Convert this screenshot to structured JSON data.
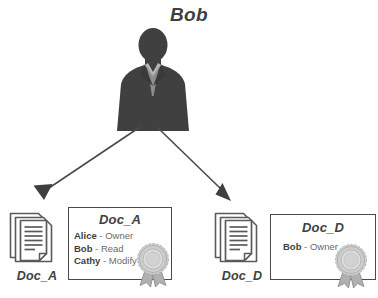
{
  "diagram": {
    "title_person": "Bob",
    "person": {
      "name": "Bob",
      "icon": "person-silhouette-icon"
    },
    "colors": {
      "silhouette": "#404040",
      "shirt": "#b9b9b9",
      "arrow": "#4a4a4a",
      "box_border": "#4a4a4a",
      "label_text": "#3f3f3f",
      "entry_text": "#6b6b6b",
      "seal": "#c8c8c8",
      "background": "#ffffff"
    },
    "documents": [
      {
        "id": "doc-a",
        "caption": "Doc_A",
        "icon": "document-stack-icon",
        "acl": {
          "title": "Doc_A",
          "seal_icon": "seal-ribbon-icon",
          "entries": [
            {
              "subject": "Alice",
              "separator": "-",
              "right": "Owner"
            },
            {
              "subject": "Bob",
              "separator": "-",
              "right": "Read"
            },
            {
              "subject": "Cathy",
              "separator": "-",
              "right": "Modify"
            }
          ]
        }
      },
      {
        "id": "doc-d",
        "caption": "Doc_D",
        "icon": "document-stack-icon",
        "acl": {
          "title": "Doc_D",
          "seal_icon": "seal-ribbon-icon",
          "entries": [
            {
              "subject": "Bob",
              "separator": "-",
              "right": "Owner"
            }
          ]
        }
      }
    ],
    "arrows": [
      {
        "name": "arrow-bob-to-doc-a",
        "from": "Bob",
        "to": "Doc_A"
      },
      {
        "name": "arrow-bob-to-doc-d",
        "from": "Bob",
        "to": "Doc_D"
      }
    ]
  }
}
